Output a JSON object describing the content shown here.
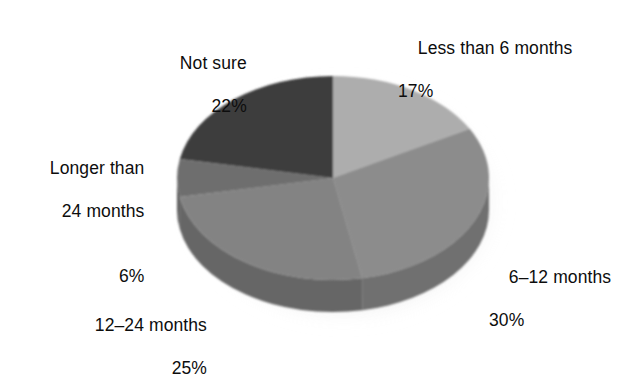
{
  "chart_data": {
    "type": "pie",
    "title": "",
    "subtitle": "",
    "xlabel": "",
    "ylabel": "",
    "legend_position": "none",
    "grid": false,
    "units": "percent",
    "three_d": true,
    "start_angle_deg": 0,
    "direction": "clockwise",
    "categories": [
      "Less than 6 months",
      "6–12 months",
      "12–24 months",
      "Longer than 24 months",
      "Not sure"
    ],
    "values": [
      17,
      30,
      25,
      6,
      22
    ],
    "value_labels": [
      "17%",
      "30%",
      "25%",
      "6%",
      "22%"
    ],
    "slices": [
      {
        "label": "Less than 6 months",
        "value": 17,
        "value_label": "17%",
        "color": "#adadad",
        "side_color": "#8f8f8f",
        "start_deg": 0,
        "end_deg": 61.2
      },
      {
        "label": "6–12 months",
        "value": 30,
        "value_label": "30%",
        "color": "#8c8c8c",
        "side_color": "#6f6f6f",
        "start_deg": 61.2,
        "end_deg": 169.2
      },
      {
        "label": "12–24 months",
        "value": 25,
        "value_label": "25%",
        "color": "#838383",
        "side_color": "#666666",
        "start_deg": 169.2,
        "end_deg": 259.2
      },
      {
        "label": "Longer than 24 months",
        "value": 6,
        "value_label": "6%",
        "color": "#6e6e6e",
        "side_color": "#575757",
        "start_deg": 259.2,
        "end_deg": 280.8
      },
      {
        "label": "Not sure",
        "value": 22,
        "value_label": "22%",
        "color": "#3e3e3e",
        "side_color": "#323232",
        "start_deg": 280.8,
        "end_deg": 360
      }
    ]
  },
  "labels": {
    "less_than_6": {
      "name": "Less than 6 months",
      "value": "17%"
    },
    "six_to_12": {
      "name": "6–12 months",
      "value": "30%"
    },
    "twelve_to_24": {
      "name": "12–24 months",
      "value": "25%"
    },
    "longer_than_24": {
      "name": "Longer than",
      "name2": "24 months",
      "value": "6%"
    },
    "not_sure": {
      "name": "Not sure",
      "value": "22%"
    }
  },
  "colors": {
    "background": "#ffffff",
    "text": "#0d0d0d",
    "slice_lightest": "#adadad",
    "slice_light": "#8c8c8c",
    "slice_mid": "#838383",
    "slice_dark": "#6e6e6e",
    "slice_darkest": "#3e3e3e",
    "shadow": "#bdbdbd"
  }
}
